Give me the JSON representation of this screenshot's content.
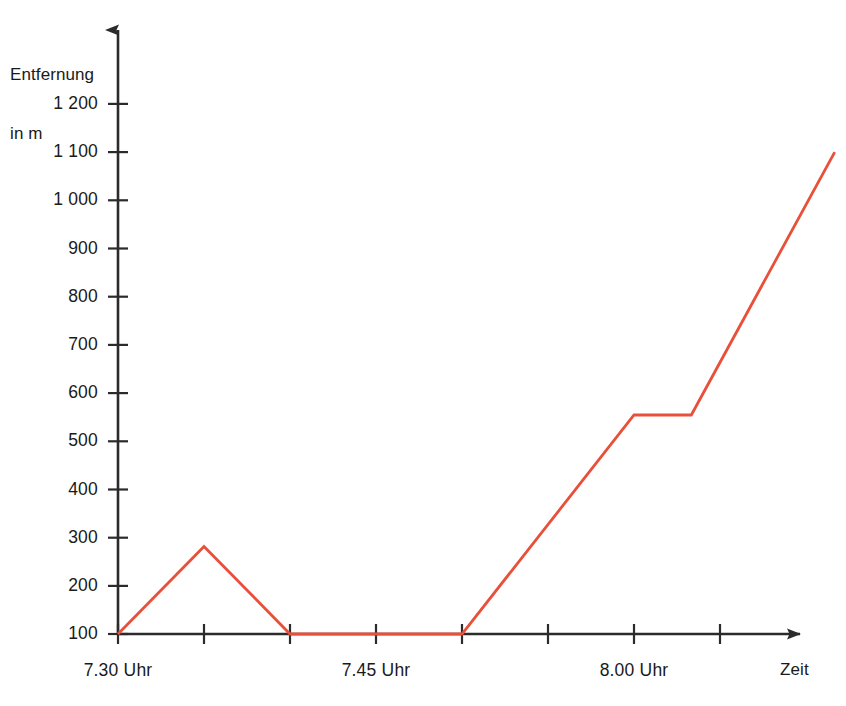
{
  "chart_data": {
    "type": "line",
    "title": "",
    "subtitle": "",
    "xlabel": "Zeit",
    "ylabel": "Entfernung\nin m",
    "ylabel_line1": "Entfernung",
    "ylabel_line2": "in m",
    "grid": false,
    "legend": "none",
    "ylim": [
      0,
      1280
    ],
    "xlim": [
      0,
      30
    ],
    "y_ticks": [
      100,
      200,
      300,
      400,
      500,
      600,
      700,
      800,
      900,
      1000,
      1100,
      1200
    ],
    "y_tick_labels": [
      "100",
      "200",
      "300",
      "400",
      "500",
      "600",
      "700",
      "800",
      "900",
      "1 000",
      "1 100",
      "1 200"
    ],
    "x_ticks_minutes": [
      0,
      3,
      6,
      9,
      12,
      15,
      18,
      21,
      24,
      27
    ],
    "x_tick_labels": [
      "7.30 Uhr",
      "",
      "",
      "",
      "",
      "7.45 Uhr",
      "",
      "",
      "8.00 Uhr",
      ""
    ],
    "x_labeled_ticks": [
      {
        "minutes": 0,
        "label": "7.30 Uhr"
      },
      {
        "minutes": 15,
        "label": "7.45 Uhr"
      },
      {
        "minutes": 30,
        "label": "8.00 Uhr"
      }
    ],
    "series": [
      {
        "name": "Entfernung",
        "color": "#E8503A",
        "points": [
          {
            "x_minutes": 0,
            "time": "7.30",
            "y": 0
          },
          {
            "x_minutes": 3,
            "time": "7.33",
            "y": 200
          },
          {
            "x_minutes": 6,
            "time": "7.36",
            "y": 0
          },
          {
            "x_minutes": 12,
            "time": "7.42",
            "y": 0
          },
          {
            "x_minutes": 18,
            "time": "7.48",
            "y": 500
          },
          {
            "x_minutes": 20,
            "time": "7.50",
            "y": 500
          },
          {
            "x_minutes": 25,
            "time": "7.55",
            "y": 1100
          }
        ]
      }
    ],
    "axis_color": "#333333",
    "line_color": "#E8503A"
  },
  "axes": {
    "y_title_line1": "Entfernung",
    "y_title_line2": "in m",
    "x_title": "Zeit"
  },
  "y_labels": [
    "1 200",
    "1 100",
    "1 000",
    "900",
    "800",
    "700",
    "600",
    "500",
    "400",
    "300",
    "200",
    "100"
  ],
  "x_labels": [
    "7.30 Uhr",
    "7.45 Uhr",
    "8.00 Uhr"
  ]
}
